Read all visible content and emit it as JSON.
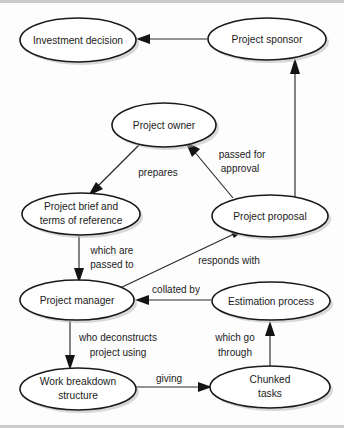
{
  "diagram": {
    "type": "directed-graph",
    "colors": {
      "background": "#fdfdfd",
      "node_fill": "#ffffff",
      "node_stroke": "#1a1a1a",
      "edge_stroke": "#2a2a2a",
      "text": "#1b1b1b",
      "shadow": "#b9b9b9"
    },
    "nodes": [
      {
        "id": "investment_decision",
        "label": "Investment decision",
        "lines": [
          "Investment decision"
        ],
        "cx": 78,
        "cy": 40,
        "rx": 58,
        "ry": 22
      },
      {
        "id": "project_sponsor",
        "label": "Project sponsor",
        "lines": [
          "Project sponsor"
        ],
        "cx": 267,
        "cy": 39,
        "rx": 59,
        "ry": 21
      },
      {
        "id": "project_owner",
        "label": "Project owner",
        "lines": [
          "Project owner"
        ],
        "cx": 164,
        "cy": 125,
        "rx": 52,
        "ry": 22
      },
      {
        "id": "project_brief",
        "label": "Project brief and terms of reference",
        "lines": [
          "Project brief and",
          "terms of reference"
        ],
        "cx": 81,
        "cy": 214,
        "rx": 59,
        "ry": 21
      },
      {
        "id": "project_proposal",
        "label": "Project proposal",
        "lines": [
          "Project proposal"
        ],
        "cx": 270,
        "cy": 216,
        "rx": 58,
        "ry": 21
      },
      {
        "id": "project_manager",
        "label": "Project manager",
        "lines": [
          "Project manager"
        ],
        "cx": 77,
        "cy": 300,
        "rx": 57,
        "ry": 20
      },
      {
        "id": "estimation_process",
        "label": "Estimation process",
        "lines": [
          "Estimation process"
        ],
        "cx": 271,
        "cy": 301,
        "rx": 59,
        "ry": 19
      },
      {
        "id": "work_breakdown",
        "label": "Work breakdown structure",
        "lines": [
          "Work breakdown",
          "structure"
        ],
        "cx": 78,
        "cy": 389,
        "rx": 58,
        "ry": 21
      },
      {
        "id": "chunked_tasks",
        "label": "Chunked tasks",
        "lines": [
          "Chunked",
          "tasks"
        ],
        "cx": 270,
        "cy": 387,
        "rx": 60,
        "ry": 21
      }
    ],
    "edges": [
      {
        "id": "sponsor_to_investment",
        "from": "project_sponsor",
        "to": "investment_decision",
        "label": ""
      },
      {
        "id": "proposal_to_sponsor",
        "from": "project_proposal",
        "to": "project_sponsor",
        "label": ""
      },
      {
        "id": "owner_to_brief",
        "from": "project_owner",
        "to": "project_brief",
        "label": "prepares"
      },
      {
        "id": "proposal_to_owner",
        "from": "project_proposal",
        "to": "project_owner",
        "label": "passed for approval",
        "label_lines": [
          "passed for",
          "approval"
        ]
      },
      {
        "id": "brief_to_manager",
        "from": "project_brief",
        "to": "project_manager",
        "label": "which are passed to",
        "label_lines": [
          "which are",
          "passed to"
        ]
      },
      {
        "id": "manager_to_proposal",
        "from": "project_manager",
        "to": "project_proposal",
        "label": "responds with",
        "label_lines": [
          "responds with"
        ]
      },
      {
        "id": "estimation_to_manager",
        "from": "estimation_process",
        "to": "project_manager",
        "label": "collated by",
        "label_lines": [
          "collated by"
        ]
      },
      {
        "id": "manager_to_wbs",
        "from": "project_manager",
        "to": "work_breakdown",
        "label": "who deconstructs project using",
        "label_lines": [
          "who deconstructs",
          "project using"
        ]
      },
      {
        "id": "wbs_to_chunked",
        "from": "work_breakdown",
        "to": "chunked_tasks",
        "label": "giving",
        "label_lines": [
          "giving"
        ]
      },
      {
        "id": "chunked_to_estimation",
        "from": "chunked_tasks",
        "to": "estimation_process",
        "label": "which go through",
        "label_lines": [
          "which go",
          "through"
        ]
      }
    ]
  }
}
